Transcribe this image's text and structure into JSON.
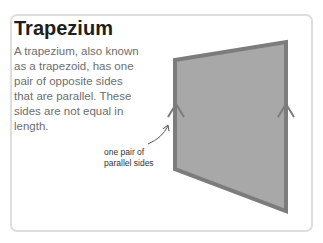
{
  "card": {
    "title": "Trapezium",
    "description": "A trapezium, also known as a trapezoid, has one pair of opposite sides that are parallel. These sides are not equal in length.",
    "annotation": {
      "line1": "one pair of",
      "line2": "parallel sides"
    }
  },
  "figure": {
    "shape": "trapezium",
    "vertices": [
      [
        175,
        60
      ],
      [
        286,
        42
      ],
      [
        286,
        211
      ],
      [
        175,
        169
      ]
    ],
    "fill_color": "#a8a8a8",
    "stroke_color": "#7c7c7c",
    "parallel_marks": [
      "chevron-left-side",
      "chevron-right-side"
    ]
  },
  "colors": {
    "title": "#1e1e1e",
    "body_text": "#6e6e6e",
    "card_border": "#dedede"
  }
}
